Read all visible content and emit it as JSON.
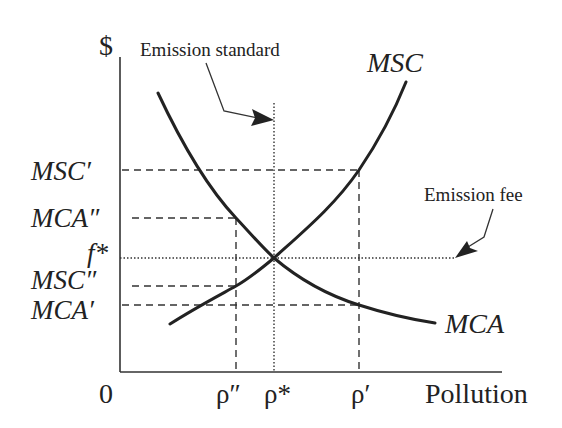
{
  "diagram": {
    "y_axis_label": "$",
    "x_axis_label": "Pollution",
    "origin_label": "0",
    "curves": {
      "msc": {
        "label": "MSC",
        "description": "Marginal social cost (upward sloping)"
      },
      "mca": {
        "label": "MCA",
        "description": "Marginal cost of abatement (downward sloping)"
      }
    },
    "y_ticks": {
      "msc_prime": "MSC′",
      "mca_double_prime": "MCA″",
      "f_star": "f*",
      "msc_double_prime": "MSC″",
      "mca_prime": "MCA′"
    },
    "x_ticks": {
      "rho_double_prime": "ρ″",
      "rho_star": "ρ*",
      "rho_prime": "ρ′"
    },
    "annotations": {
      "emission_standard": "Emission standard",
      "emission_fee": "Emission fee"
    },
    "colors": {
      "line": "#222222",
      "background": "#ffffff"
    }
  }
}
